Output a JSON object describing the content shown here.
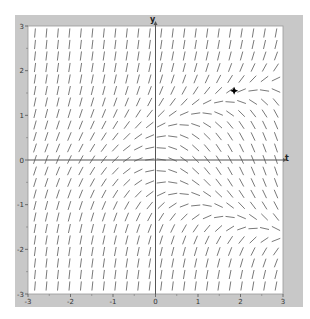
{
  "chart_data": {
    "type": "slope_field",
    "title": "",
    "equation": "dy/dt = y^2 - t",
    "xlabel": "t",
    "ylabel": "y",
    "xlim": [
      -3,
      3
    ],
    "ylim": [
      -3,
      3
    ],
    "x_ticks": [
      -3,
      -2,
      -1,
      0,
      1,
      2,
      3
    ],
    "y_ticks": [
      -3,
      -2,
      -1,
      0,
      1,
      2,
      3
    ],
    "x_tick_labels": [
      "-3",
      "-2",
      "-1",
      "0",
      "1",
      "2",
      "3"
    ],
    "y_tick_labels": [
      "-3",
      "-2",
      "-1",
      "0",
      "1",
      "2",
      "3"
    ],
    "grid": false,
    "legend": null,
    "grid_columns": 22,
    "grid_rows": 23,
    "marker": {
      "t": 1.85,
      "y": 1.55,
      "shape": "four-point-star",
      "color": "#000000"
    }
  },
  "colors": {
    "frame": "#c8c8c8",
    "plot_bg": "#ffffff",
    "axis": "#555555",
    "segment": "#6a6a6a",
    "marker": "#000000"
  }
}
